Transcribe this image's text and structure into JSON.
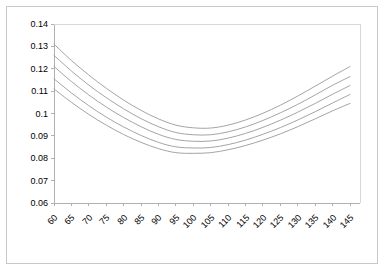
{
  "chart_data": {
    "type": "line",
    "title": "",
    "subtitle": "",
    "xlabel": "",
    "ylabel": "",
    "xlim": [
      60,
      145
    ],
    "ylim": [
      0.06,
      0.14
    ],
    "grid": false,
    "legend": "none",
    "background": "#ffffff",
    "line_color": "#9a9a9a",
    "axis_color": "#b0b0b0",
    "frame_color": "#c9c9c9",
    "x_tick_labels": [
      "60",
      "65",
      "70",
      "75",
      "80",
      "85",
      "90",
      "95",
      "100",
      "105",
      "110",
      "115",
      "120",
      "125",
      "130",
      "135",
      "140",
      "145"
    ],
    "y_tick_labels": [
      "0.06",
      "0.07",
      "0.08",
      "0.09",
      "0.1",
      "0.11",
      "0.12",
      "0.13",
      "0.14"
    ],
    "x_tick_values": [
      60,
      65,
      70,
      75,
      80,
      85,
      90,
      95,
      100,
      105,
      110,
      115,
      120,
      125,
      130,
      135,
      140,
      145
    ],
    "y_tick_values": [
      0.06,
      0.07,
      0.08,
      0.09,
      0.1,
      0.11,
      0.12,
      0.13,
      0.14
    ],
    "x": [
      60,
      65,
      70,
      75,
      80,
      85,
      90,
      95,
      100,
      105,
      110,
      115,
      120,
      125,
      130,
      135,
      140,
      145
    ],
    "series": [
      {
        "name": "curve-1",
        "values": [
          0.131,
          0.1237,
          0.1172,
          0.1113,
          0.106,
          0.1014,
          0.0976,
          0.0948,
          0.0936,
          0.0935,
          0.0948,
          0.0971,
          0.1001,
          0.1037,
          0.1078,
          0.1122,
          0.1167,
          0.121
        ]
      },
      {
        "name": "curve-2",
        "values": [
          0.126,
          0.119,
          0.1127,
          0.1071,
          0.1021,
          0.0977,
          0.0941,
          0.0915,
          0.0905,
          0.0905,
          0.0918,
          0.094,
          0.0969,
          0.1003,
          0.1041,
          0.1083,
          0.1126,
          0.1165
        ]
      },
      {
        "name": "curve-3",
        "values": [
          0.121,
          0.1143,
          0.1083,
          0.1029,
          0.0982,
          0.0941,
          0.0907,
          0.0884,
          0.0876,
          0.0877,
          0.089,
          0.0911,
          0.0938,
          0.097,
          0.1006,
          0.1045,
          0.1086,
          0.1125
        ]
      },
      {
        "name": "curve-4",
        "values": [
          0.1155,
          0.1092,
          0.1035,
          0.0984,
          0.094,
          0.0902,
          0.0871,
          0.0851,
          0.0846,
          0.0848,
          0.0861,
          0.0881,
          0.0907,
          0.0937,
          0.0971,
          0.1008,
          0.1047,
          0.1085
        ]
      },
      {
        "name": "curve-5",
        "values": [
          0.111,
          0.105,
          0.0996,
          0.0948,
          0.0906,
          0.0871,
          0.0843,
          0.0825,
          0.0822,
          0.0825,
          0.0838,
          0.0857,
          0.0881,
          0.0909,
          0.0941,
          0.0976,
          0.1012,
          0.1045
        ]
      }
    ]
  }
}
